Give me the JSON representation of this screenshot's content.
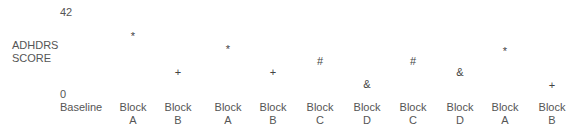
{
  "chart_data": {
    "type": "scatter",
    "title": "",
    "xlabel": "",
    "ylabel": "ADHDRS SCORE",
    "ylim": [
      0,
      42
    ],
    "y_ticks": [
      "42",
      "0"
    ],
    "grid": false,
    "categories": [
      "Baseline",
      "Block A",
      "Block B",
      "Block A",
      "Block B",
      "Block C",
      "Block D",
      "Block C",
      "Block D",
      "Block A",
      "Block B"
    ],
    "category_lines": [
      [
        "Baseline",
        ""
      ],
      [
        "Block",
        "A"
      ],
      [
        "Block",
        "B"
      ],
      [
        "Block",
        "A"
      ],
      [
        "Block",
        "B"
      ],
      [
        "Block",
        "C"
      ],
      [
        "Block",
        "D"
      ],
      [
        "Block",
        "C"
      ],
      [
        "Block",
        "D"
      ],
      [
        "Block",
        "A"
      ],
      [
        "Block",
        "B"
      ]
    ],
    "points": [
      {
        "category_index": 1,
        "marker": "*",
        "value": 32
      },
      {
        "category_index": 2,
        "marker": "+",
        "value": 11
      },
      {
        "category_index": 3,
        "marker": "*",
        "value": 25
      },
      {
        "category_index": 4,
        "marker": "+",
        "value": 11
      },
      {
        "category_index": 5,
        "marker": "#",
        "value": 17
      },
      {
        "category_index": 6,
        "marker": "&",
        "value": 5
      },
      {
        "category_index": 7,
        "marker": "#",
        "value": 17
      },
      {
        "category_index": 8,
        "marker": "&",
        "value": 11
      },
      {
        "category_index": 9,
        "marker": "*",
        "value": 24
      },
      {
        "category_index": 10,
        "marker": "+",
        "value": 4
      }
    ],
    "legend": {
      "*": "Block A",
      "+": "Block B",
      "#": "Block C",
      "&": "Block D"
    }
  }
}
